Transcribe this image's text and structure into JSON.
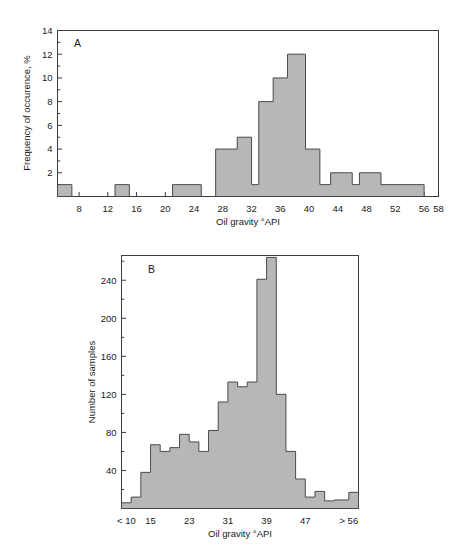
{
  "figure": {
    "background": "#ffffff",
    "bar_fill": "#b7b7b7",
    "bar_stroke": "#4a4a4a",
    "axis_color": "#3b3b3b"
  },
  "chart_data": [
    {
      "type": "bar",
      "panel_label": "A",
      "title": "",
      "xlabel": "Oil gravity °API",
      "ylabel": "Frequency of occurence, %",
      "xlim": [
        5,
        58
      ],
      "ylim": [
        0,
        14
      ],
      "grid": false,
      "legend": "none",
      "xticks": [
        8,
        12,
        16,
        20,
        24,
        28,
        32,
        36,
        40,
        44,
        48,
        52,
        56,
        58
      ],
      "xtick_labels": [
        "8",
        "12",
        "16",
        "20",
        "24",
        "28",
        "32",
        "36",
        "40",
        "44",
        "48",
        "52",
        "56",
        "58"
      ],
      "yticks": [
        2,
        4,
        6,
        8,
        10,
        12,
        14
      ],
      "ytick_labels": [
        "2",
        "4",
        "6",
        "8",
        "10",
        "12",
        "14"
      ],
      "bins": [
        {
          "x0": 5.0,
          "x1": 7.0,
          "value": 1
        },
        {
          "x0": 13.0,
          "x1": 15.0,
          "value": 1
        },
        {
          "x0": 21.0,
          "x1": 25.0,
          "value": 1
        },
        {
          "x0": 27.0,
          "x1": 30.0,
          "value": 4
        },
        {
          "x0": 30.0,
          "x1": 32.0,
          "value": 5
        },
        {
          "x0": 32.0,
          "x1": 33.0,
          "value": 1
        },
        {
          "x0": 33.0,
          "x1": 35.0,
          "value": 8
        },
        {
          "x0": 35.0,
          "x1": 37.0,
          "value": 10
        },
        {
          "x0": 37.0,
          "x1": 39.5,
          "value": 12
        },
        {
          "x0": 39.5,
          "x1": 41.5,
          "value": 4
        },
        {
          "x0": 41.5,
          "x1": 43.0,
          "value": 1
        },
        {
          "x0": 43.0,
          "x1": 46.0,
          "value": 2
        },
        {
          "x0": 46.0,
          "x1": 47.0,
          "value": 1
        },
        {
          "x0": 47.0,
          "x1": 50.0,
          "value": 2
        },
        {
          "x0": 50.0,
          "x1": 56.0,
          "value": 1
        }
      ]
    },
    {
      "type": "bar",
      "panel_label": "B",
      "title": "",
      "xlabel": "Oil gravity °API",
      "ylabel": "Number of samples",
      "xlim": [
        9,
        58
      ],
      "ylim": [
        0,
        266
      ],
      "grid": false,
      "legend": "none",
      "xticks": [
        10,
        15,
        23,
        31,
        39,
        47,
        56
      ],
      "xtick_labels": [
        "< 10",
        "15",
        "23",
        "31",
        "39",
        "47",
        "> 56"
      ],
      "yticks": [
        40,
        80,
        120,
        160,
        200,
        240
      ],
      "ytick_labels": [
        "40",
        "80",
        "120",
        "160",
        "200",
        "240"
      ],
      "bins": [
        {
          "x0": 9,
          "x1": 11,
          "value": 6
        },
        {
          "x0": 11,
          "x1": 13,
          "value": 12
        },
        {
          "x0": 13,
          "x1": 15,
          "value": 38
        },
        {
          "x0": 15,
          "x1": 17,
          "value": 67
        },
        {
          "x0": 17,
          "x1": 19,
          "value": 60
        },
        {
          "x0": 19,
          "x1": 21,
          "value": 64
        },
        {
          "x0": 21,
          "x1": 23,
          "value": 78
        },
        {
          "x0": 23,
          "x1": 25,
          "value": 70
        },
        {
          "x0": 25,
          "x1": 27,
          "value": 60
        },
        {
          "x0": 27,
          "x1": 29,
          "value": 82
        },
        {
          "x0": 29,
          "x1": 31,
          "value": 112
        },
        {
          "x0": 31,
          "x1": 33,
          "value": 133
        },
        {
          "x0": 33,
          "x1": 35,
          "value": 128
        },
        {
          "x0": 35,
          "x1": 37,
          "value": 133
        },
        {
          "x0": 37,
          "x1": 39,
          "value": 241
        },
        {
          "x0": 39,
          "x1": 41,
          "value": 264
        },
        {
          "x0": 41,
          "x1": 43,
          "value": 120
        },
        {
          "x0": 43,
          "x1": 45,
          "value": 60
        },
        {
          "x0": 45,
          "x1": 47,
          "value": 31
        },
        {
          "x0": 47,
          "x1": 49,
          "value": 12
        },
        {
          "x0": 49,
          "x1": 51,
          "value": 18
        },
        {
          "x0": 51,
          "x1": 53,
          "value": 8
        },
        {
          "x0": 53,
          "x1": 56,
          "value": 9
        },
        {
          "x0": 56,
          "x1": 58,
          "value": 17
        }
      ]
    }
  ]
}
